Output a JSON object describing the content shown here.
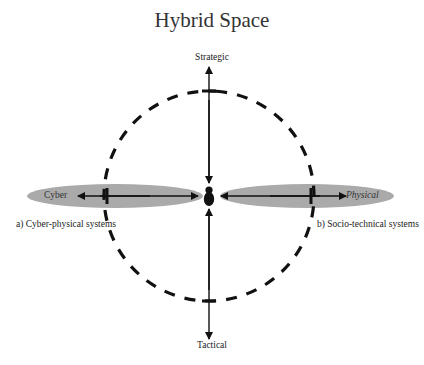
{
  "title": "Hybrid Space",
  "axes": {
    "vertical": {
      "top_label": "Strategic",
      "bottom_label": "Tactical"
    },
    "horizontal": {
      "left_label": "Cyber",
      "right_label": "Physical"
    }
  },
  "regions": {
    "left": {
      "caption": "a) Cyber-physical systems",
      "fill": "#aaaaaa"
    },
    "right": {
      "caption": "b) Socio-technical systems",
      "fill": "#aaaaaa"
    }
  },
  "center_icon": "person-icon",
  "colors": {
    "ink": "#111111",
    "ellipse": "#aaaaaa",
    "background": "#ffffff"
  }
}
